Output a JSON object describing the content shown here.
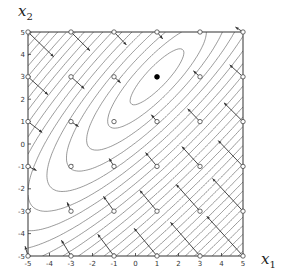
{
  "chart_data": {
    "type": "contour",
    "title": "",
    "xlabel": "x1",
    "ylabel": "x2",
    "xlim": [
      -5,
      5
    ],
    "ylim": [
      -5,
      5
    ],
    "xticks": [
      -5,
      -4,
      -3,
      -2,
      -1,
      0,
      1,
      2,
      3,
      4,
      5
    ],
    "yticks": [
      -5,
      -4,
      -3,
      -2,
      -1,
      0,
      1,
      2,
      3,
      4,
      5
    ],
    "grid": false,
    "legend": null,
    "minimum_marker": {
      "x": 1,
      "y": 3,
      "style": "filled-black-dot"
    },
    "function_form": "quadratic bowl, elongated along diagonal x2 ≈ x1 + 2",
    "contour_levels": 40,
    "sample_points": {
      "x": [
        -5,
        -3,
        -1,
        1,
        3,
        5
      ],
      "y": [
        5,
        3,
        1,
        -1,
        -3,
        -5
      ],
      "marker": "open-circle"
    },
    "arrows_description": "descent-direction arrows drawn from each sample point (open circle) pointing toward decreasing function value; longest at bottom-right"
  },
  "labels": {
    "x_axis": "x",
    "x_axis_sub": "1",
    "y_axis": "x",
    "y_axis_sub": "2"
  },
  "colors": {
    "contour": "#555555",
    "frame": "#333333",
    "arrow": "#333333",
    "marker": "#000000"
  }
}
